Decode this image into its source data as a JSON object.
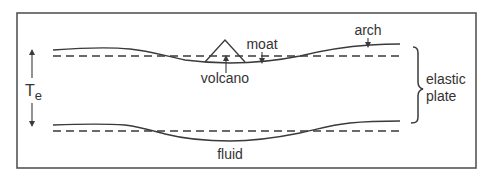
{
  "diagram": {
    "colors": {
      "line": "#3a3a3a",
      "frame": "#555555",
      "text": "#333333",
      "background": "#ffffff"
    },
    "labels": {
      "volcano": "volcano",
      "moat": "moat",
      "arch": "arch",
      "fluid": "fluid",
      "thickness_symbol": "T",
      "thickness_subscript": "e",
      "plate_line1": "elastic",
      "plate_line2": "plate"
    },
    "elements": [
      {
        "name": "top-surface-deflected",
        "style": "solid"
      },
      {
        "name": "top-surface-reference",
        "style": "dashed"
      },
      {
        "name": "bottom-surface-deflected",
        "style": "solid"
      },
      {
        "name": "bottom-surface-reference",
        "style": "dashed"
      },
      {
        "name": "volcano-triangle",
        "style": "solid"
      },
      {
        "name": "thickness-arrows",
        "style": "double-arrow"
      },
      {
        "name": "plate-brace",
        "style": "curly-brace"
      }
    ]
  }
}
